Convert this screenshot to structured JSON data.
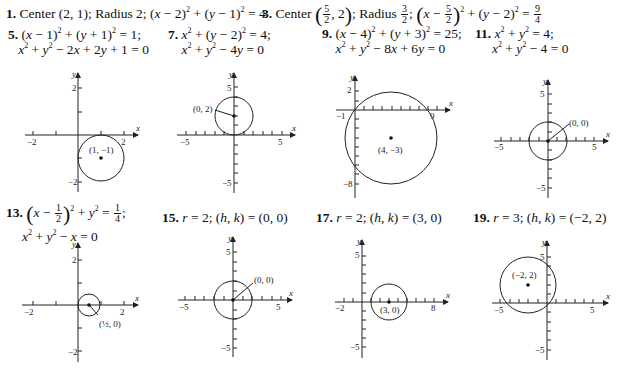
{
  "problems": [
    {
      "num": "1.",
      "text": "Center (2, 1); Radius 2; (x − 2)² + (y − 1)² = 4"
    },
    {
      "num": "3.",
      "text_pre": "Center",
      "center_frac": {
        "n": "5",
        "d": "2"
      },
      "center_rest": ", 2",
      "radius_label": "; Radius",
      "radius_frac": {
        "n": "3",
        "d": "2"
      },
      "eq": "(x − 5/2)² + (y − 2)² = 9/4"
    },
    {
      "num": "5.",
      "line1": "(x − 1)² + (y + 1)² = 1;",
      "line2": "x² + y² − 2x + 2y + 1 = 0",
      "graph": {
        "center": [
          1,
          -1
        ],
        "radius": 1,
        "label": "(1, −1)",
        "xticks": [
          "−2",
          "2"
        ],
        "yticks": [
          "2",
          "−2"
        ]
      }
    },
    {
      "num": "7.",
      "line1": "x² + (y − 2)² = 4;",
      "line2": "x² + y² − 4y = 0",
      "graph": {
        "center": [
          0,
          2
        ],
        "radius": 2,
        "label": "(0, 2)",
        "xticks": [
          "−5",
          "5"
        ],
        "yticks": [
          "5",
          "−5"
        ]
      }
    },
    {
      "num": "9.",
      "line1": "(x − 4)² + (y + 3)² = 25;",
      "line2": "x² + y² − 8x + 6y = 0",
      "graph": {
        "center": [
          4,
          -3
        ],
        "radius": 5,
        "label": "(4, −3)",
        "xticks": [
          "−1",
          "9"
        ],
        "yticks": [
          "2",
          "−8"
        ]
      }
    },
    {
      "num": "11.",
      "line1": "x² + y² = 4;",
      "line2": "x² + y² − 4 = 0",
      "graph": {
        "center": [
          0,
          0
        ],
        "radius": 2,
        "label": "(0, 0)",
        "xticks": [
          "−5",
          "5"
        ],
        "yticks": [
          "5",
          "−5"
        ]
      }
    },
    {
      "num": "13.",
      "line1": "(x − 1/2)² + y² = 1/4;",
      "line2": "x² + y² − x = 0",
      "graph": {
        "center": [
          0.5,
          0
        ],
        "radius": 0.5,
        "label": "(1/2, 0)",
        "xticks": [
          "−2",
          "2"
        ],
        "yticks": [
          "2",
          "−2"
        ]
      }
    },
    {
      "num": "15.",
      "line1": "r = 2; (h, k) = (0, 0)",
      "graph": {
        "center": [
          0,
          0
        ],
        "radius": 2,
        "label": "(0, 0)",
        "xticks": [
          "−5",
          "5"
        ],
        "yticks": [
          "5",
          "−5"
        ]
      }
    },
    {
      "num": "17.",
      "line1": "r = 2; (h, k) = (3, 0)",
      "graph": {
        "center": [
          3,
          0
        ],
        "radius": 2,
        "label": "(3, 0)",
        "xticks": [
          "−2",
          "8"
        ],
        "yticks": [
          "5",
          "−5"
        ]
      }
    },
    {
      "num": "19.",
      "line1": "r = 3; (h, k) = (−2, 2)",
      "graph": {
        "center": [
          -2,
          2
        ],
        "radius": 3,
        "label": "(−2, 2)",
        "xticks": [
          "−5",
          "5"
        ],
        "yticks": [
          "5",
          "−5"
        ]
      }
    }
  ],
  "axis": {
    "x": "x",
    "y": "y"
  }
}
